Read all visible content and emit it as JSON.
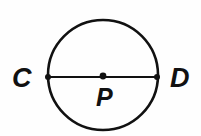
{
  "figure": {
    "type": "geometry-diagram",
    "background_color": "#fefefe",
    "ink_color": "#111111",
    "canvas": {
      "width": 201,
      "height": 136
    },
    "circle": {
      "name": "circle-P",
      "center_x": 103,
      "center_y": 75,
      "radius": 55,
      "stroke_width": 2.6
    },
    "diameter": {
      "name": "segment-CD",
      "x1": 48,
      "y1": 77,
      "x2": 157,
      "y2": 77,
      "stroke_width": 1.9
    },
    "points": [
      {
        "id": "C",
        "label": "C",
        "role": "diameter-endpoint-left",
        "dot_x": 48,
        "dot_y": 77,
        "dot_r": 3.0,
        "label_x": 12,
        "label_y": 87
      },
      {
        "id": "P",
        "label": "P",
        "role": "center",
        "dot_x": 103,
        "dot_y": 76,
        "dot_r": 3.4,
        "label_x": 96,
        "label_y": 106
      },
      {
        "id": "D",
        "label": "D",
        "role": "diameter-endpoint-right",
        "dot_x": 157,
        "dot_y": 77,
        "dot_r": 3.0,
        "label_x": 170,
        "label_y": 87
      }
    ]
  }
}
